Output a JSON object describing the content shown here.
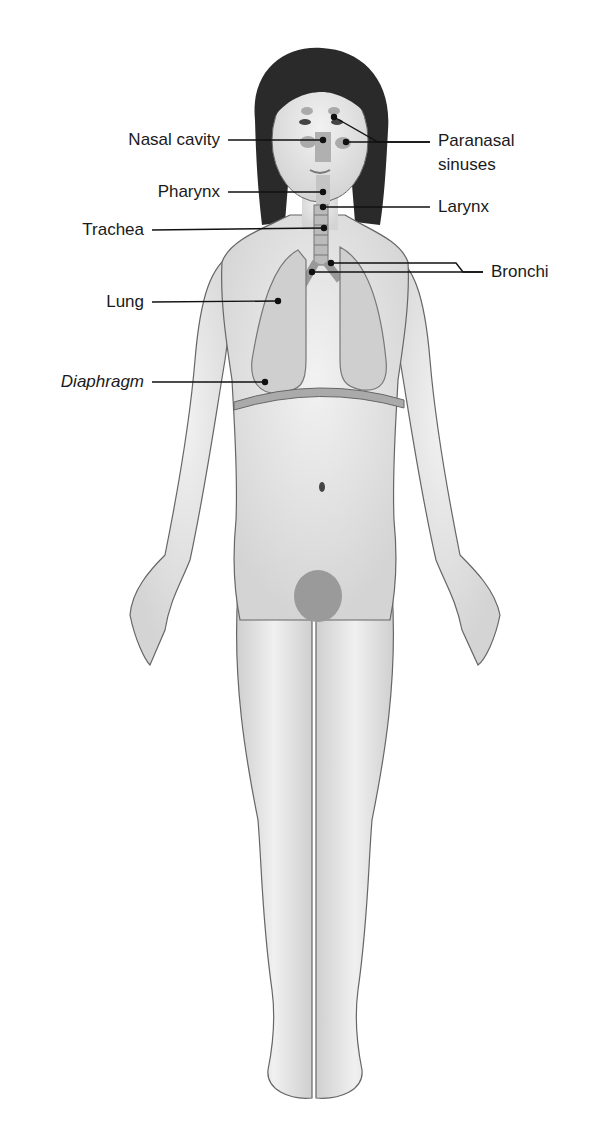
{
  "diagram": {
    "labels": {
      "nasal_cavity": "Nasal cavity",
      "paranasal_sinuses_line1": "Paranasal",
      "paranasal_sinuses_line2": "sinuses",
      "pharynx": "Pharynx",
      "larynx": "Larynx",
      "trachea": "Trachea",
      "bronchi": "Bronchi",
      "lung": "Lung",
      "diaphragm": "Diaphragm"
    },
    "colors": {
      "skin": "#e6e6e6",
      "outline": "#555555",
      "hair": "#2a2a2a",
      "lung": "#c9c9c9",
      "leader_line": "#111111"
    }
  }
}
